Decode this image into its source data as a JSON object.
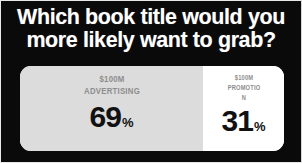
{
  "poll": {
    "question_line1": "Which book title would you",
    "question_line2": "more likely want to grab?",
    "options": [
      {
        "id": "advertising",
        "label_line1": "$100M",
        "label_line2": "ADVERTISING",
        "value": "69",
        "unit": "%"
      },
      {
        "id": "promotion",
        "label_line1": "$100M",
        "label_line2": "PROMOTIO N",
        "value": "31",
        "unit": "%"
      }
    ]
  },
  "colors": {
    "background": "#0a0a0a",
    "heading_text": "#ffffff",
    "option_label_text": "#8d8d8d",
    "option_value_text": "#111111",
    "advertising_fill": "#dcdcdc",
    "promotion_fill": "#ffffff"
  }
}
